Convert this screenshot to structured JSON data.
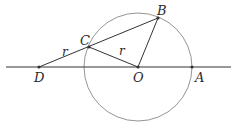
{
  "diagram": {
    "colors": {
      "line": "#333333",
      "circle": "#888888",
      "point": "#333333"
    },
    "points": {
      "D": {
        "label": "D",
        "x": 39,
        "y": 67
      },
      "C": {
        "label": "C",
        "x": 89,
        "y": 47
      },
      "O": {
        "label": "O",
        "x": 138,
        "y": 67
      },
      "B": {
        "label": "B",
        "x": 158,
        "y": 18
      },
      "A": {
        "label": "A",
        "x": 192,
        "y": 67
      }
    },
    "circle": {
      "center": "O",
      "radius": 54
    },
    "line": {
      "x1": 6,
      "x2": 231,
      "y": 67
    },
    "segment_labels": {
      "DC": "r",
      "CO": "r"
    }
  }
}
